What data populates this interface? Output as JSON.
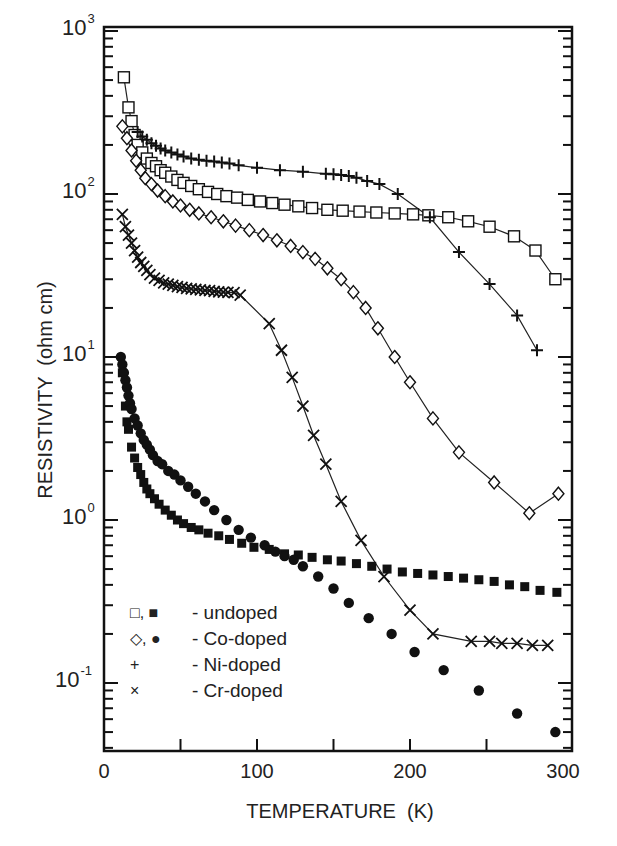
{
  "chart_data": {
    "type": "scatter",
    "title": "",
    "xlabel": "TEMPERATURE  (K)",
    "ylabel": "RESISTIVITY  (ohm cm)",
    "xlim": [
      0,
      300
    ],
    "ylim": [
      0.04,
      1000
    ],
    "yscale": "log",
    "grid": false,
    "legend_position": "lower left",
    "x_ticks": [
      "0",
      "100",
      "200",
      "300"
    ],
    "y_ticks": [
      {
        "base": "10",
        "exp": "3"
      },
      {
        "base": "10",
        "exp": "2"
      },
      {
        "base": "10",
        "exp": "1"
      },
      {
        "base": "10",
        "exp": "0"
      },
      {
        "base": "10",
        "exp": "-1"
      }
    ],
    "legend": [
      {
        "symbols": "□, ■",
        "label": "- undoped"
      },
      {
        "symbols": "◇, ●",
        "label": "- Co-doped"
      },
      {
        "symbols": "+",
        "label": "- Ni-doped"
      },
      {
        "symbols": "×",
        "label": "- Cr-doped"
      }
    ],
    "series": [
      {
        "name": "undoped (open)",
        "marker": "open-square",
        "line": true,
        "x": [
          13,
          16,
          18,
          20,
          22,
          25,
          28,
          31,
          34,
          37,
          40,
          44,
          48,
          52,
          57,
          62,
          68,
          74,
          80,
          87,
          94,
          102,
          110,
          118,
          127,
          136,
          146,
          156,
          167,
          178,
          190,
          202,
          212,
          225,
          238,
          252,
          268,
          282,
          295
        ],
        "y": [
          520,
          340,
          280,
          230,
          200,
          180,
          165,
          155,
          148,
          140,
          135,
          128,
          122,
          117,
          112,
          107,
          103,
          100,
          97,
          95,
          92,
          90,
          88,
          86,
          84,
          82,
          80,
          79,
          78,
          77,
          76,
          75,
          74,
          72,
          68,
          63,
          55,
          45,
          30
        ]
      },
      {
        "name": "Ni-doped",
        "marker": "plus",
        "line": true,
        "x": [
          22,
          25,
          28,
          31,
          34,
          37,
          40,
          44,
          48,
          52,
          57,
          62,
          67,
          72,
          77,
          82,
          88,
          100,
          115,
          130,
          145,
          150,
          155,
          160,
          165,
          172,
          180,
          192,
          213,
          232,
          252,
          270,
          283
        ],
        "y": [
          240,
          225,
          215,
          205,
          198,
          190,
          185,
          180,
          175,
          170,
          165,
          162,
          160,
          158,
          156,
          154,
          150,
          145,
          140,
          137,
          133,
          132,
          131,
          129,
          126,
          120,
          115,
          100,
          72,
          44,
          28,
          18,
          11
        ]
      },
      {
        "name": "Co-doped (open)",
        "marker": "open-diamond",
        "line": true,
        "x": [
          12,
          15,
          18,
          21,
          24,
          27,
          31,
          35,
          40,
          45,
          50,
          56,
          62,
          70,
          78,
          86,
          95,
          104,
          113,
          122,
          130,
          138,
          146,
          155,
          163,
          171,
          179,
          190,
          200,
          215,
          232,
          255,
          278,
          297
        ],
        "y": [
          260,
          220,
          185,
          160,
          140,
          125,
          115,
          105,
          97,
          90,
          85,
          80,
          76,
          72,
          68,
          64,
          60,
          56,
          52,
          48,
          44,
          40,
          35,
          30,
          25,
          20,
          15,
          10,
          7,
          4.2,
          2.6,
          1.7,
          1.1,
          1.45
        ]
      },
      {
        "name": "Cr-doped",
        "marker": "cross",
        "line": true,
        "x": [
          12,
          14,
          16,
          18,
          20,
          22,
          24,
          26,
          28,
          30,
          33,
          36,
          39,
          42,
          45,
          48,
          51,
          54,
          57,
          60,
          63,
          66,
          69,
          72,
          75,
          78,
          81,
          85,
          89,
          108,
          116,
          123,
          130,
          137,
          145,
          155,
          168,
          183,
          200,
          215,
          240,
          252,
          260,
          270,
          280,
          290
        ],
        "y": [
          75,
          63,
          56,
          50,
          45,
          41,
          38,
          36,
          34,
          32,
          30.5,
          29.5,
          28.5,
          28,
          27.5,
          27,
          26.7,
          26.4,
          26.2,
          26,
          25.8,
          25.6,
          25.5,
          25.3,
          25.1,
          25,
          24.9,
          24.8,
          24,
          16,
          11,
          7.5,
          5,
          3.3,
          2.2,
          1.3,
          0.75,
          0.45,
          0.28,
          0.2,
          0.18,
          0.18,
          0.175,
          0.175,
          0.17,
          0.17
        ]
      },
      {
        "name": "undoped (filled)",
        "marker": "filled-square",
        "line": false,
        "x": [
          12,
          14,
          15,
          16,
          18,
          20,
          22,
          24,
          26,
          28,
          30,
          33,
          36,
          40,
          44,
          48,
          52,
          57,
          62,
          68,
          75,
          82,
          90,
          98,
          108,
          118,
          127,
          136,
          146,
          155,
          165,
          175,
          185,
          195,
          205,
          215,
          225,
          235,
          245,
          255,
          265,
          275,
          285,
          296
        ],
        "y": [
          8,
          5,
          4,
          3.6,
          2.8,
          2.4,
          2.1,
          1.9,
          1.7,
          1.55,
          1.45,
          1.35,
          1.25,
          1.15,
          1.07,
          1.0,
          0.95,
          0.9,
          0.87,
          0.83,
          0.8,
          0.76,
          0.72,
          0.68,
          0.66,
          0.62,
          0.61,
          0.59,
          0.57,
          0.56,
          0.54,
          0.52,
          0.5,
          0.48,
          0.47,
          0.46,
          0.45,
          0.44,
          0.43,
          0.42,
          0.4,
          0.39,
          0.37,
          0.36
        ]
      },
      {
        "name": "Co-doped (filled)",
        "marker": "filled-circle",
        "line": false,
        "x": [
          11,
          12,
          13,
          14,
          15,
          16,
          17,
          18,
          20,
          22,
          24,
          26,
          28,
          30,
          32,
          35,
          38,
          42,
          46,
          50,
          55,
          60,
          66,
          72,
          80,
          88,
          96,
          105,
          112,
          118,
          124,
          130,
          140,
          150,
          160,
          173,
          188,
          203,
          222,
          245,
          270,
          295
        ],
        "y": [
          10,
          9,
          8,
          7.2,
          6.5,
          5.8,
          5.2,
          4.8,
          4.2,
          3.8,
          3.4,
          3.1,
          2.9,
          2.7,
          2.5,
          2.3,
          2.2,
          2.0,
          1.9,
          1.75,
          1.6,
          1.45,
          1.3,
          1.15,
          1.0,
          0.87,
          0.78,
          0.7,
          0.64,
          0.6,
          0.57,
          0.52,
          0.45,
          0.38,
          0.31,
          0.25,
          0.2,
          0.155,
          0.12,
          0.09,
          0.065,
          0.05
        ]
      }
    ]
  },
  "layout": {
    "plot": {
      "left": 104,
      "right": 572,
      "top": 27,
      "bottom": 751
    },
    "x_origin_px": 104,
    "x_scale": 1.53,
    "y_decade0_px": 520,
    "y_px_per_decade": 163
  }
}
